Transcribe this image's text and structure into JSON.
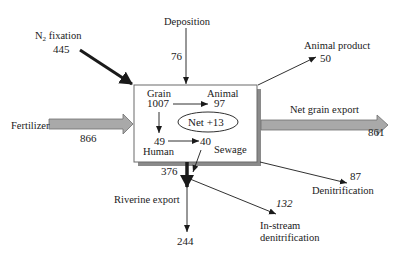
{
  "diagram": {
    "type": "nitrogen-budget-flow",
    "box": {
      "nodes": [
        {
          "name": "Grain",
          "value": "1007"
        },
        {
          "name": "Animal",
          "value": "97"
        },
        {
          "name": "Human",
          "value": "49"
        },
        {
          "name": "Sewage",
          "value": "40"
        }
      ],
      "net_label": "Net +13"
    },
    "inputs": [
      {
        "label_main": "N",
        "label_sub": "2",
        "label_rest": " fixation",
        "value": "445"
      },
      {
        "label": "Deposition",
        "value": "76"
      },
      {
        "label": "Fertilizer",
        "value": "866"
      }
    ],
    "outputs": [
      {
        "label": "Animal product",
        "value": "50"
      },
      {
        "label": "Net grain export",
        "value": "861"
      },
      {
        "label": "Denitrification",
        "value": "87"
      },
      {
        "label": "Riverine export",
        "value": "244",
        "inflow_value": "376"
      },
      {
        "label_line1": "In-stream",
        "label_line2": "denitrification",
        "value": "132"
      }
    ],
    "internal_flows": [
      {
        "from": "Grain",
        "to": "Animal"
      },
      {
        "from": "Grain",
        "to": "Human"
      },
      {
        "from": "Human",
        "to": "Sewage"
      },
      {
        "from": "Sewage",
        "to": "Riverine export"
      }
    ],
    "colors": {
      "block_arrow_fill": "#a9a9a9",
      "block_arrow_stroke": "#6e6e6e",
      "box_shadow": "#8a8a8a",
      "line": "#1a1a1a"
    }
  }
}
